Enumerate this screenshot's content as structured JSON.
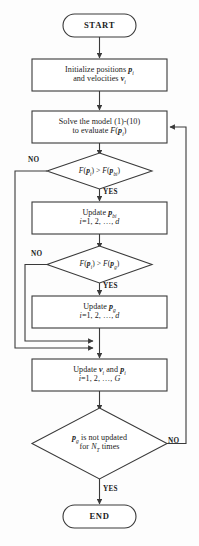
{
  "diagram": {
    "type": "flowchart",
    "background_color": "#fdfdfd",
    "line_color": "#3a3a3a",
    "text_color": "#1b1b1b"
  },
  "nodes": [
    {
      "id": "start",
      "shape": "terminator",
      "label": "START",
      "lines": [
        "START"
      ]
    },
    {
      "id": "initialize",
      "shape": "process",
      "label": "Initialize positions and velocities",
      "lines": [
        "Initialize positions p",
        "and velocities v"
      ],
      "line1_main": "Initialize positions ",
      "line1_var": "p",
      "line1_sub": "i",
      "line2_main": "and velocities ",
      "line2_var": "v",
      "line2_sub": "i"
    },
    {
      "id": "solve-model",
      "shape": "process",
      "label": "Solve the model and evaluate fitness",
      "line1": "Solve the model (1)-(10)",
      "line2_main": "to evaluate ",
      "line2_fn": "F",
      "line2_open": "(",
      "line2_var": "p",
      "line2_sub": "i",
      "line2_close": ")"
    },
    {
      "id": "decision-personal-best",
      "shape": "decision",
      "label": "F(p i) > F(p bi)",
      "fn": "F",
      "lhs_var": "p",
      "lhs_sub": "i",
      "op": ">",
      "rhs_var": "p",
      "rhs_sub": "bi"
    },
    {
      "id": "update-personal-best",
      "shape": "process",
      "label": "Update p bi",
      "line1_main": "Update ",
      "line1_var": "p",
      "line1_sub": "bi",
      "line2": "i=1, 2, …, d",
      "line2_prefix": "i",
      "line2_rest": "=1, 2, …, ",
      "line2_suffix": "d"
    },
    {
      "id": "decision-global-best",
      "shape": "decision",
      "label": "F(p i) > F(p g)",
      "fn": "F",
      "lhs_var": "p",
      "lhs_sub": "i",
      "op": ">",
      "rhs_var": "p",
      "rhs_sub": "g"
    },
    {
      "id": "update-global-best",
      "shape": "process",
      "label": "Update p g",
      "line1_main": "Update ",
      "line1_var": "p",
      "line1_sub": "g",
      "line2_prefix": "i",
      "line2_rest": "=1, 2, …, ",
      "line2_suffix": "d"
    },
    {
      "id": "update-velocity-position",
      "shape": "process",
      "label": "Update v i and p i",
      "line1_main": "Update ",
      "line1_var1": "v",
      "line1_sub1": "i",
      "line1_mid": " and ",
      "line1_var2": "p",
      "line1_sub2": "i",
      "line2_prefix": "i",
      "line2_rest": "=1, 2, …, ",
      "line2_suffix": "G"
    },
    {
      "id": "decision-termination",
      "shape": "decision",
      "label": "p g is not updated for N T times",
      "line1_var": "p",
      "line1_sub": "g",
      "line1_rest": " is not updated",
      "line2_pre": "for  ",
      "line2_var": "N",
      "line2_sub": "T",
      "line2_post": " times"
    },
    {
      "id": "end",
      "shape": "terminator",
      "label": "END",
      "lines": [
        "END"
      ]
    }
  ],
  "edge_labels": {
    "no_personal_best": "NO",
    "yes_personal_best": "YES",
    "no_global_best": "NO",
    "yes_global_best": "YES",
    "no_termination": "NO",
    "yes_termination": "YES"
  }
}
